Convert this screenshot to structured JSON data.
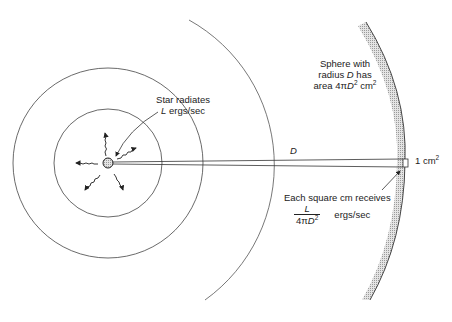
{
  "diagram": {
    "star_label": {
      "line1": "Star radiates",
      "line2_var": "L",
      "line2_unit": " ergs/sec"
    },
    "sphere_label": {
      "line1": "Sphere with",
      "line2_pre": "radius ",
      "line2_var": "D",
      "line2_post": " has",
      "line3_pre": "area 4π",
      "line3_var": "D",
      "line3_sup": "2",
      "line3_post": " cm",
      "line3_sup2": "2"
    },
    "distance_label": "D",
    "area_label": {
      "text": "1 cm",
      "sup": "2"
    },
    "receive_label": {
      "line1": "Each square cm receives",
      "num": "L",
      "den_pre": "4π",
      "den_var": "D",
      "den_sup": "2",
      "unit": "ergs/sec"
    },
    "colors": {
      "line": "#444444",
      "shade": "#bdbdbd",
      "text": "#222222"
    }
  }
}
